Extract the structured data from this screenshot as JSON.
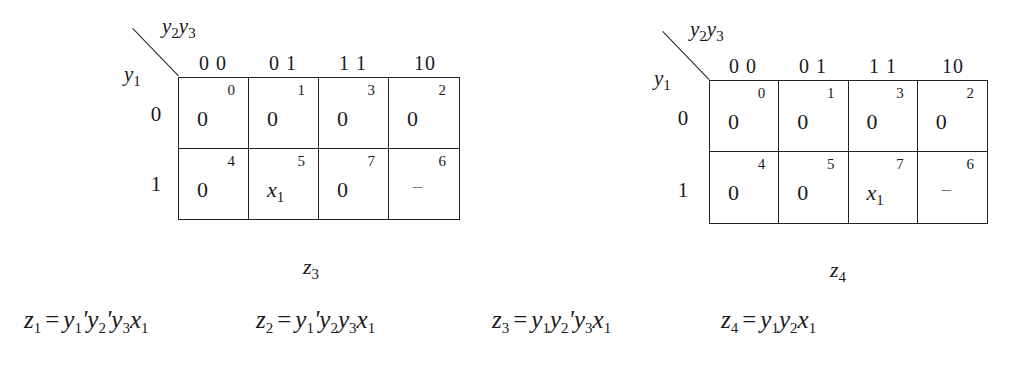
{
  "maps": [
    {
      "name": "z3",
      "label_sym": "z",
      "label_sub": "3",
      "col_var": {
        "a": "y",
        "a_sub": "2",
        "b": "y",
        "b_sub": "3"
      },
      "row_var": {
        "a": "y",
        "a_sub": "1"
      },
      "col_headers": [
        "0 0",
        "0 1",
        "1 1",
        "10"
      ],
      "row_headers": [
        "0",
        "1"
      ],
      "cells": [
        [
          {
            "value": "0",
            "index": "0"
          },
          {
            "value": "0",
            "index": "1"
          },
          {
            "value": "0",
            "index": "3"
          },
          {
            "value": "0",
            "index": "2"
          }
        ],
        [
          {
            "value": "0",
            "index": "4"
          },
          {
            "value": "x",
            "value_sub": "1",
            "index": "5"
          },
          {
            "value": "0",
            "index": "7"
          },
          {
            "value": "–",
            "index": "6"
          }
        ]
      ]
    },
    {
      "name": "z4",
      "label_sym": "z",
      "label_sub": "4",
      "col_var": {
        "a": "y",
        "a_sub": "2",
        "b": "y",
        "b_sub": "3"
      },
      "row_var": {
        "a": "y",
        "a_sub": "1"
      },
      "col_headers": [
        "0 0",
        "0 1",
        "1 1",
        "10"
      ],
      "row_headers": [
        "0",
        "1"
      ],
      "cells": [
        [
          {
            "value": "0",
            "index": "0"
          },
          {
            "value": "0",
            "index": "1"
          },
          {
            "value": "0",
            "index": "3"
          },
          {
            "value": "0",
            "index": "2"
          }
        ],
        [
          {
            "value": "0",
            "index": "4"
          },
          {
            "value": "0",
            "index": "5"
          },
          {
            "value": "x",
            "value_sub": "1",
            "index": "7"
          },
          {
            "value": "–",
            "index": "6"
          }
        ]
      ]
    }
  ],
  "equations": [
    {
      "lhs": "z",
      "lhs_sub": "1",
      "eq": "=",
      "terms": [
        [
          "y",
          "1",
          "'"
        ],
        [
          "y",
          "2",
          "'"
        ],
        [
          "y",
          "3",
          ""
        ],
        [
          "x",
          "1",
          ""
        ]
      ]
    },
    {
      "lhs": "z",
      "lhs_sub": "2",
      "eq": "=",
      "terms": [
        [
          "y",
          "1",
          "'"
        ],
        [
          "y",
          "2",
          ""
        ],
        [
          "y",
          "3",
          ""
        ],
        [
          "x",
          "1",
          ""
        ]
      ]
    },
    {
      "lhs": "z",
      "lhs_sub": "3",
      "eq": "=",
      "terms": [
        [
          "y",
          "1",
          ""
        ],
        [
          "y",
          "2",
          "'"
        ],
        [
          "y",
          "3",
          ""
        ],
        [
          "x",
          "1",
          ""
        ]
      ]
    },
    {
      "lhs": "z",
      "lhs_sub": "4",
      "eq": "=",
      "terms": [
        [
          "y",
          "1",
          ""
        ],
        [
          "y",
          "2",
          ""
        ],
        [
          "x",
          "1",
          ""
        ]
      ]
    }
  ]
}
